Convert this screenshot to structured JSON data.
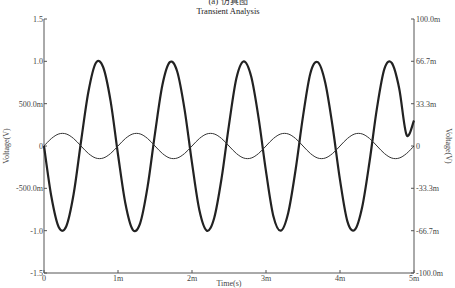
{
  "caption": "(a) 仿真图",
  "chart_data": {
    "type": "line",
    "title": "Transient Analysis",
    "xlabel": "Time(s)",
    "ylabel_left": "Voltage(V)",
    "ylabel_right": "Voltage(V)",
    "xlim": [
      0,
      0.005
    ],
    "ylim_left": [
      -1.5,
      1.5
    ],
    "ylim_right": [
      -0.1,
      0.1
    ],
    "x_ticks": [
      {
        "value": 0,
        "label": "0"
      },
      {
        "value": 0.001,
        "label": "1m"
      },
      {
        "value": 0.002,
        "label": "2m"
      },
      {
        "value": 0.003,
        "label": "3m"
      },
      {
        "value": 0.004,
        "label": "4m"
      },
      {
        "value": 0.005,
        "label": "5m"
      }
    ],
    "y_ticks_left": [
      {
        "value": 1.5,
        "label": "1.5"
      },
      {
        "value": 1.0,
        "label": "1.0"
      },
      {
        "value": 0.5,
        "label": "500.0m"
      },
      {
        "value": 0,
        "label": "0"
      },
      {
        "value": -0.5,
        "label": "-500.0m"
      },
      {
        "value": -1.0,
        "label": "-1.0"
      },
      {
        "value": -1.5,
        "label": "-1.5"
      }
    ],
    "y_ticks_right": [
      {
        "value": 0.1,
        "label": "100.0m"
      },
      {
        "value": 0.0667,
        "label": "66.7m"
      },
      {
        "value": 0.0333,
        "label": "33.3m"
      },
      {
        "value": 0,
        "label": "0"
      },
      {
        "value": -0.0333,
        "label": "-33.3m"
      },
      {
        "value": -0.0667,
        "label": "-66.7m"
      },
      {
        "value": -0.1,
        "label": "-100.0m"
      }
    ],
    "grid": false,
    "legend": null,
    "series": [
      {
        "name": "large sinusoid (left axis)",
        "axis": "left",
        "amplitude": 1.0,
        "frequency_hz": 1015,
        "phase": "inverted (negative first)",
        "color": "#222222",
        "stroke_width": 2.2,
        "x": [
          0,
          0.0001,
          0.0002,
          0.0003,
          0.0004,
          0.0005,
          0.0006,
          0.0007,
          0.0008,
          0.0009,
          0.001,
          0.0011,
          0.0012,
          0.0013,
          0.0014,
          0.0015,
          0.0016,
          0.0017,
          0.0018,
          0.0019,
          0.002,
          0.0021,
          0.0022,
          0.0023,
          0.0024,
          0.0025,
          0.0026,
          0.0027,
          0.0028,
          0.0029,
          0.003,
          0.0031,
          0.0032,
          0.0033,
          0.0034,
          0.0035,
          0.0036,
          0.0037,
          0.0038,
          0.0039,
          0.004,
          0.0041,
          0.0042,
          0.0043,
          0.0044,
          0.0045,
          0.0046,
          0.0047,
          0.0048,
          0.0049,
          0.005
        ],
        "values": [
          0,
          -0.6,
          -0.96,
          -0.95,
          -0.57,
          0.05,
          0.64,
          0.98,
          0.93,
          0.53,
          -0.1,
          -0.68,
          -0.99,
          -0.91,
          -0.48,
          0.15,
          0.72,
          0.99,
          0.88,
          0.43,
          -0.2,
          -0.76,
          -1.0,
          -0.85,
          -0.38,
          0.25,
          0.8,
          1.0,
          0.82,
          0.33,
          -0.3,
          -0.83,
          -1.0,
          -0.79,
          -0.28,
          0.35,
          0.86,
          0.99,
          0.75,
          0.23,
          -0.4,
          -0.89,
          -0.99,
          -0.72,
          -0.18,
          0.45,
          0.91,
          0.98,
          0.68,
          0.13,
          0.3
        ]
      },
      {
        "name": "small sinusoid (right axis)",
        "axis": "right",
        "amplitude": 0.01,
        "frequency_hz": 1000,
        "phase": "normal (positive first)",
        "color": "#333333",
        "stroke_width": 1,
        "x": [
          0,
          0.0001,
          0.0002,
          0.0003,
          0.0004,
          0.0005,
          0.0006,
          0.0007,
          0.0008,
          0.0009,
          0.001,
          0.0011,
          0.0012,
          0.0013,
          0.0014,
          0.0015,
          0.0016,
          0.0017,
          0.0018,
          0.0019,
          0.002,
          0.0021,
          0.0022,
          0.0023,
          0.0024,
          0.0025,
          0.0026,
          0.0027,
          0.0028,
          0.0029,
          0.003,
          0.0031,
          0.0032,
          0.0033,
          0.0034,
          0.0035,
          0.0036,
          0.0037,
          0.0038,
          0.0039,
          0.004,
          0.0041,
          0.0042,
          0.0043,
          0.0044,
          0.0045,
          0.0046,
          0.0047,
          0.0048,
          0.0049,
          0.005
        ],
        "values": [
          0,
          0.0059,
          0.0095,
          0.0095,
          0.0059,
          0,
          -0.0059,
          -0.0095,
          -0.0095,
          -0.0059,
          0,
          0.0059,
          0.0095,
          0.0095,
          0.0059,
          0,
          -0.0059,
          -0.0095,
          -0.0095,
          -0.0059,
          0,
          0.0059,
          0.0095,
          0.0095,
          0.0059,
          0,
          -0.0059,
          -0.0095,
          -0.0095,
          -0.0059,
          0,
          0.0059,
          0.0095,
          0.0095,
          0.0059,
          0,
          -0.0059,
          -0.0095,
          -0.0095,
          -0.0059,
          0,
          0.0059,
          0.0095,
          0.0095,
          0.0059,
          0,
          -0.0059,
          -0.0095,
          -0.0095,
          -0.0059,
          0
        ]
      }
    ]
  }
}
